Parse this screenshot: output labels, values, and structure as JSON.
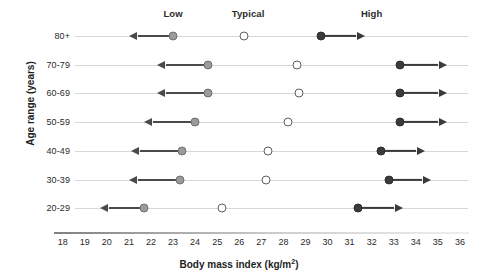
{
  "chart_data": {
    "type": "scatter",
    "title": "",
    "xlabel": "Body mass index (kg/m2)",
    "ylabel": "Age range (years)",
    "xlim": [
      18,
      36
    ],
    "xticks": [
      18,
      19,
      20,
      21,
      22,
      23,
      24,
      25,
      26,
      27,
      28,
      29,
      30,
      31,
      32,
      33,
      34,
      35,
      36
    ],
    "grid": true,
    "legend_position": "top",
    "band_labels": [
      {
        "label": "Low",
        "bmi": 23.0
      },
      {
        "label": "Typical",
        "bmi": 26.4
      },
      {
        "label": "High",
        "bmi": 32.0
      }
    ],
    "categories": [
      "80+",
      "70-79",
      "60-69",
      "50-59",
      "40-49",
      "30-39",
      "20-29"
    ],
    "series": [
      {
        "name": "Low",
        "marker": "filled-gray-circle",
        "arrow": "left",
        "values": [
          23.0,
          24.6,
          24.6,
          24.0,
          23.4,
          23.3,
          21.7
        ],
        "arrow_ends": [
          21.4,
          22.7,
          22.7,
          22.1,
          21.5,
          21.4,
          20.1
        ]
      },
      {
        "name": "Typical",
        "marker": "open-circle",
        "arrow": "none",
        "values": [
          26.2,
          28.6,
          28.7,
          28.2,
          27.3,
          27.2,
          25.2
        ]
      },
      {
        "name": "High",
        "marker": "filled-dark-circle",
        "arrow": "right",
        "values": [
          29.7,
          33.3,
          33.3,
          33.3,
          32.4,
          32.8,
          31.4
        ],
        "arrow_ends": [
          31.3,
          35.0,
          35.0,
          35.0,
          34.0,
          34.3,
          33.0
        ]
      }
    ]
  },
  "colors": {
    "low_marker": "#9b9b9b",
    "typical_marker": "#ffffff",
    "high_marker": "#3b3b3b",
    "arrow": "#4a4a4a",
    "gridline": "#d7d7d7",
    "text": "#1e1e1e"
  }
}
